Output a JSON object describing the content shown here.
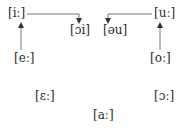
{
  "diagram": {
    "type": "vowel-shift-diagram",
    "colors": {
      "text": "#2a2a2a",
      "line": "#555555",
      "background": "#ffffff"
    },
    "nodes": [
      {
        "id": "ii",
        "label": "[iː]"
      },
      {
        "id": "oi",
        "label": "[ɔi]"
      },
      {
        "id": "au",
        "label": "[əu]"
      },
      {
        "id": "uu",
        "label": "[uː]"
      },
      {
        "id": "ee",
        "label": "[eː]"
      },
      {
        "id": "oo",
        "label": "[oː]"
      },
      {
        "id": "eps",
        "label": "[ɛː]"
      },
      {
        "id": "openo",
        "label": "[ɔː]"
      },
      {
        "id": "aa",
        "label": "[aː]"
      }
    ],
    "edges": [
      {
        "from": "[eː]",
        "to": "[iː]"
      },
      {
        "from": "[iː]",
        "to": "[ɔi]"
      },
      {
        "from": "[oː]",
        "to": "[uː]"
      },
      {
        "from": "[uː]",
        "to": "[əu]"
      }
    ]
  }
}
